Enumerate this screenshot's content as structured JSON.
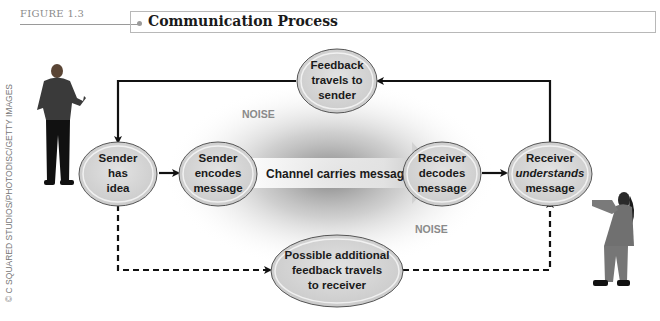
{
  "figure": {
    "label": "FIGURE 1.3",
    "title": "Communication Process"
  },
  "credit": "© C SQUARED STUDIOS/PHOTODISC/GETTY IMAGES",
  "nodes": {
    "sender_idea": [
      "Sender",
      "has",
      "idea"
    ],
    "sender_encodes": [
      "Sender",
      "encodes",
      "message"
    ],
    "channel": "Channel carries message",
    "receiver_decodes": [
      "Receiver",
      "decodes",
      "message"
    ],
    "receiver_understands": [
      "Receiver",
      "understands",
      "message"
    ],
    "feedback": [
      "Feedback",
      "travels to",
      "sender"
    ],
    "additional_feedback": [
      "Possible additional",
      "feedback travels",
      "to receiver"
    ]
  },
  "noise_labels": [
    "NOISE",
    "NOISE"
  ],
  "figures": {
    "sender_person": "man-figure",
    "receiver_person": "woman-figure"
  },
  "colors": {
    "node_fill": "#d6d6d6",
    "node_stroke": "#555555",
    "arrow": "#111111",
    "noise_text": "#8a8a8a",
    "title_border": "#b8b8b8"
  }
}
